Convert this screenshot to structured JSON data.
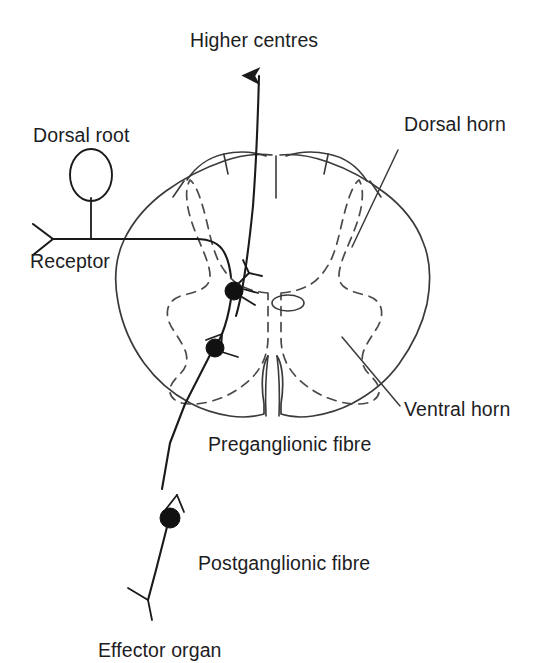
{
  "figure": {
    "kind": "anatomical-diagram",
    "ink_color": "#1d1d1f",
    "line_color": "#3a3a3c",
    "grey_matter_color": "#4a4a4c",
    "background": "#ffffff"
  },
  "labels": {
    "higher_centres": "Higher centres",
    "dorsal_root": "Dorsal root",
    "dorsal_horn": "Dorsal horn",
    "receptor": "Receptor",
    "ventral_horn": "Ventral horn",
    "preganglionic_fibre": "Preganglionic fibre",
    "postganglionic_fibre": "Postganglionic fibre",
    "effector_organ": "Effector organ"
  },
  "structures": {
    "spinal_cord_outline": "white matter boundary, oval scalloped",
    "grey_matter": "butterfly-shaped dashed outline",
    "central_canal": "small ellipse at centre",
    "dorsal_median_sulcus": "short vertical notch at top",
    "ventral_median_fissure": "deep vertical cleft at bottom",
    "dorsal_root_ganglion": "ellipse on dorsal root",
    "interneuron_soma": "filled circle in dorsal grey matter",
    "preganglionic_soma": "filled circle in lateral grey matter",
    "autonomic_ganglion_soma": "filled circle on peripheral fibre",
    "receptor_terminal": "chevron symbol",
    "effector_terminal": "fork symbol",
    "ascending_tract_arrow": "arrow to higher centres"
  }
}
